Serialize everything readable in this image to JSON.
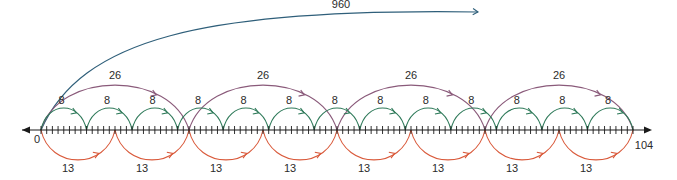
{
  "diagram": {
    "type": "number-line-jumps",
    "axis": {
      "min": 0,
      "max": 104,
      "tick_step": 1,
      "start_label": "0",
      "end_label": "104"
    },
    "big_arc": {
      "label": "960",
      "color": "#2f5f7a"
    },
    "jumps": [
      {
        "name": "jumps-of-26",
        "step": 26,
        "label": "26",
        "count": 4,
        "side": "above",
        "color": "#8a5a7a"
      },
      {
        "name": "jumps-of-8",
        "step": 8,
        "label": "8",
        "count": 13,
        "side": "above",
        "color": "#2f7a5a"
      },
      {
        "name": "jumps-of-13",
        "step": 13,
        "label": "13",
        "count": 8,
        "side": "below",
        "color": "#d9593a"
      }
    ]
  },
  "colors": {
    "axis": "#1a1a1a",
    "background": "#ffffff"
  }
}
